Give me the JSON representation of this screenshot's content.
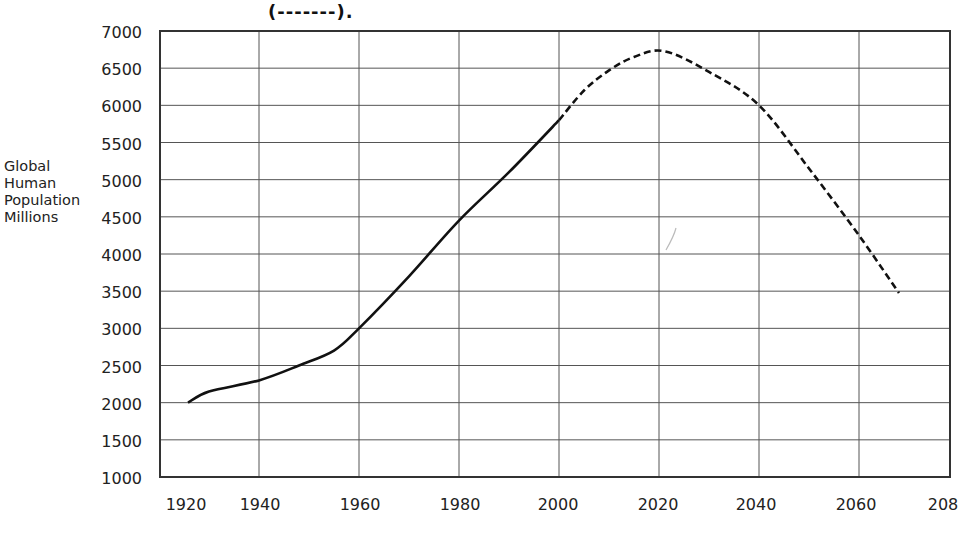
{
  "header": {
    "note_text": "(-------)."
  },
  "axes": {
    "ylabel_lines": [
      "Global",
      "Human",
      "Population",
      "Millions"
    ],
    "y_ticks": [
      "7000",
      "6500",
      "6000",
      "5500",
      "5000",
      "4500",
      "4000",
      "3500",
      "3000",
      "2500",
      "2000",
      "1500",
      "1000"
    ],
    "x_ticks": [
      "1920",
      "1940",
      "1960",
      "1980",
      "2000",
      "2020",
      "2040",
      "2060",
      "208"
    ]
  },
  "chart_data": {
    "type": "line",
    "title": "",
    "xlabel": "",
    "ylabel": "Global Human Population Millions",
    "xlim": [
      1920,
      2080
    ],
    "ylim": [
      1000,
      7000
    ],
    "grid": true,
    "x_ticks": [
      1920,
      1940,
      1960,
      1980,
      2000,
      2020,
      2040,
      2060,
      2080
    ],
    "y_ticks": [
      1000,
      1500,
      2000,
      2500,
      3000,
      3500,
      4000,
      4500,
      5000,
      5500,
      6000,
      6500,
      7000
    ],
    "annotations": [
      "(-------)."
    ],
    "series": [
      {
        "name": "Historical (solid)",
        "style": "solid",
        "x": [
          1920,
          1930,
          1940,
          1948,
          1955,
          1960,
          1970,
          1980,
          1990,
          2000
        ],
        "y": [
          2000,
          2150,
          2300,
          2500,
          2700,
          3000,
          3700,
          4450,
          5100,
          5800
        ]
      },
      {
        "name": "Projected (dashed)",
        "style": "dashed",
        "x": [
          2000,
          2005,
          2010,
          2015,
          2021,
          2030,
          2040,
          2050,
          2060,
          2068
        ],
        "y": [
          5800,
          6200,
          6470,
          6650,
          6730,
          6450,
          6000,
          5150,
          4250,
          3475
        ]
      }
    ]
  },
  "colors": {
    "line": "#111111",
    "grid": "#555555",
    "border": "#333333",
    "text": "#222222"
  }
}
